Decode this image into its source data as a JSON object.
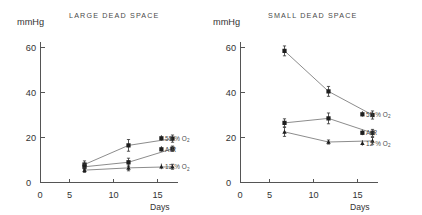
{
  "figure": {
    "panels": [
      {
        "id": "large-dead-space",
        "title": "LARGE  DEAD  SPACE",
        "y_unit": "mmHg",
        "x_label": "Days",
        "y_ticks": [
          "0",
          "20",
          "40",
          "60"
        ],
        "x_ticks": [
          "0",
          "5",
          "10",
          "15"
        ]
      },
      {
        "id": "small-dead-space",
        "title": "SMALL  DEAD  SPACE",
        "y_unit": "mmHg",
        "x_label": "Days",
        "y_ticks": [
          "0",
          "20",
          "40",
          "60"
        ],
        "x_ticks": [
          "0",
          "5",
          "10",
          "15"
        ]
      }
    ],
    "series_labels": {
      "o2_55": "55",
      "o2_55_pct": "%",
      "o2_55_gas": "O",
      "o2_55_sub": "2",
      "air": "AIR",
      "o2_12": "12",
      "o2_12_pct": "%",
      "o2_12_gas": "O",
      "o2_12_sub": "2"
    }
  },
  "chart_data": [
    {
      "type": "line",
      "title": "LARGE  DEAD  SPACE",
      "xlabel": "Days",
      "ylabel": "mmHg",
      "xlim": [
        0,
        16.5
      ],
      "ylim": [
        0,
        65
      ],
      "x": [
        5,
        10,
        15
      ],
      "xticks": [
        0,
        5,
        10,
        15
      ],
      "yticks": [
        0,
        20,
        40,
        60
      ],
      "grid": false,
      "legend": "right-inline",
      "series": [
        {
          "name": "55 % O2",
          "values": [
            8.0,
            16.5,
            19.5
          ],
          "errors": [
            1.6,
            2.6,
            1.6
          ],
          "marker": "square"
        },
        {
          "name": "AIR",
          "values": [
            7.0,
            9.0,
            15.0
          ],
          "errors": [
            1.2,
            1.8,
            1.2
          ],
          "marker": "square"
        },
        {
          "name": "12 % O2",
          "values": [
            5.5,
            6.5,
            7.0
          ],
          "errors": [
            1.0,
            1.3,
            1.1
          ],
          "marker": "triangle"
        }
      ]
    },
    {
      "type": "line",
      "title": "SMALL  DEAD  SPACE",
      "xlabel": "Days",
      "ylabel": "mmHg",
      "xlim": [
        0,
        16.5
      ],
      "ylim": [
        0,
        65
      ],
      "x": [
        5,
        10,
        15
      ],
      "xticks": [
        0,
        5,
        10,
        15
      ],
      "yticks": [
        0,
        20,
        40,
        60
      ],
      "grid": false,
      "legend": "right-inline",
      "series": [
        {
          "name": "55 % O2",
          "values": [
            58.5,
            40.5,
            30.0
          ],
          "errors": [
            2.2,
            2.2,
            1.8
          ],
          "marker": "square"
        },
        {
          "name": "AIR",
          "values": [
            26.5,
            28.5,
            22.0
          ],
          "errors": [
            1.8,
            2.4,
            1.6
          ],
          "marker": "square"
        },
        {
          "name": "12 % O2",
          "values": [
            22.5,
            18.0,
            18.5
          ],
          "errors": [
            2.0,
            0.9,
            1.5
          ],
          "marker": "triangle"
        }
      ]
    }
  ]
}
